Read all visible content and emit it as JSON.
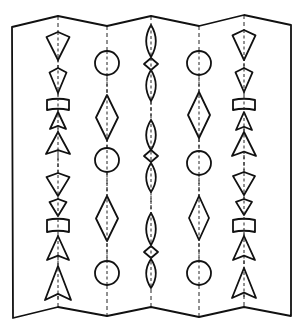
{
  "figure": {
    "stroke_color": "#111111",
    "background": "#ffffff",
    "paper": {
      "top_edge": [
        [
          12,
          27
        ],
        [
          58,
          16
        ],
        [
          107,
          26
        ],
        [
          151,
          16
        ],
        [
          199,
          26
        ],
        [
          244,
          15
        ],
        [
          291,
          25
        ]
      ],
      "bottom_edge": [
        [
          13,
          318
        ],
        [
          58,
          307
        ],
        [
          107,
          316
        ],
        [
          151,
          307
        ],
        [
          199,
          317
        ],
        [
          244,
          307
        ],
        [
          291,
          316
        ]
      ]
    },
    "folds": [
      {
        "x": 58,
        "y1": 16,
        "y2": 307
      },
      {
        "x": 107,
        "y1": 26,
        "y2": 316
      },
      {
        "x": 151,
        "y1": 16,
        "y2": 307
      },
      {
        "x": 199,
        "y1": 26,
        "y2": 317
      },
      {
        "x": 244,
        "y1": 15,
        "y2": 307
      }
    ],
    "columns": [
      {
        "name": "column-1",
        "x": 58,
        "shapes": [
          {
            "type": "kite",
            "y1": 32,
            "y2": 60,
            "w": 23
          },
          {
            "type": "kite",
            "y1": 68,
            "y2": 93,
            "w": 17
          },
          {
            "type": "curved-rect",
            "y1": 100,
            "y2": 110,
            "w": 22
          },
          {
            "type": "arrow-triangle",
            "y1": 112,
            "y2": 129,
            "w": 16
          },
          {
            "type": "arrow-triangle",
            "y1": 132,
            "y2": 154,
            "w": 24
          },
          {
            "type": "kite",
            "y1": 173,
            "y2": 196,
            "w": 23
          },
          {
            "type": "kite",
            "y1": 199,
            "y2": 216,
            "w": 17
          },
          {
            "type": "curved-rect",
            "y1": 220,
            "y2": 232,
            "w": 22
          },
          {
            "type": "arrow-triangle",
            "y1": 236,
            "y2": 260,
            "w": 22
          },
          {
            "type": "arrow-triangle",
            "y1": 266,
            "y2": 300,
            "w": 26
          }
        ]
      },
      {
        "name": "column-2",
        "x": 107,
        "shapes": [
          {
            "type": "circle",
            "cy": 63,
            "r": 12
          },
          {
            "type": "diamond",
            "y1": 95,
            "y2": 140,
            "w": 22
          },
          {
            "type": "circle",
            "cy": 160,
            "r": 12
          },
          {
            "type": "diamond",
            "y1": 196,
            "y2": 241,
            "w": 22
          },
          {
            "type": "circle",
            "cy": 273,
            "r": 12
          }
        ]
      },
      {
        "name": "column-3",
        "x": 151,
        "shapes": [
          {
            "type": "lens",
            "y1": 25,
            "y2": 57,
            "w": 12
          },
          {
            "type": "diamond",
            "y1": 58,
            "y2": 70,
            "w": 14
          },
          {
            "type": "lens",
            "y1": 70,
            "y2": 101,
            "w": 12
          },
          {
            "type": "lens",
            "y1": 120,
            "y2": 150,
            "w": 12
          },
          {
            "type": "diamond",
            "y1": 150,
            "y2": 162,
            "w": 14
          },
          {
            "type": "lens",
            "y1": 163,
            "y2": 192,
            "w": 12
          },
          {
            "type": "lens",
            "y1": 213,
            "y2": 245,
            "w": 12
          },
          {
            "type": "diamond",
            "y1": 246,
            "y2": 258,
            "w": 14
          },
          {
            "type": "lens",
            "y1": 259,
            "y2": 288,
            "w": 12
          }
        ]
      },
      {
        "name": "column-4",
        "x": 199,
        "shapes": [
          {
            "type": "circle",
            "cy": 63,
            "r": 12
          },
          {
            "type": "diamond",
            "y1": 92,
            "y2": 138,
            "w": 22
          },
          {
            "type": "circle",
            "cy": 163,
            "r": 12
          },
          {
            "type": "diamond",
            "y1": 196,
            "y2": 240,
            "w": 20
          },
          {
            "type": "circle",
            "cy": 273,
            "r": 12
          }
        ]
      },
      {
        "name": "column-5",
        "x": 244,
        "shapes": [
          {
            "type": "kite",
            "y1": 30,
            "y2": 60,
            "w": 23
          },
          {
            "type": "kite",
            "y1": 68,
            "y2": 92,
            "w": 17
          },
          {
            "type": "curved-rect",
            "y1": 100,
            "y2": 110,
            "w": 22
          },
          {
            "type": "arrow-triangle",
            "y1": 112,
            "y2": 130,
            "w": 16
          },
          {
            "type": "arrow-triangle",
            "y1": 132,
            "y2": 156,
            "w": 24
          },
          {
            "type": "kite",
            "y1": 172,
            "y2": 195,
            "w": 22
          },
          {
            "type": "kite",
            "y1": 199,
            "y2": 215,
            "w": 16
          },
          {
            "type": "curved-rect",
            "y1": 220,
            "y2": 232,
            "w": 22
          },
          {
            "type": "arrow-triangle",
            "y1": 236,
            "y2": 260,
            "w": 22
          },
          {
            "type": "arrow-triangle",
            "y1": 268,
            "y2": 298,
            "w": 24
          }
        ]
      }
    ]
  }
}
